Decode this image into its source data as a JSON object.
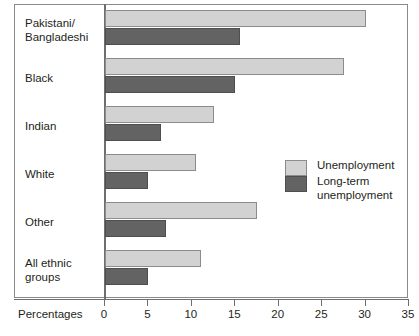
{
  "chart_data": {
    "type": "bar",
    "orientation": "horizontal",
    "title": "",
    "xlabel": "Percentages",
    "ylabel": "",
    "xlim": [
      0,
      35
    ],
    "xticks": [
      0,
      5,
      10,
      15,
      20,
      25,
      30,
      35
    ],
    "xtick_labels": [
      "0",
      "5",
      "10",
      "15",
      "20",
      "25",
      "30",
      "35"
    ],
    "grid": false,
    "legend_position": "center-right",
    "categories": [
      "Pakistani/\nBangladeshi",
      "Black",
      "Indian",
      "White",
      "Other",
      "All ethnic\ngroups"
    ],
    "series": [
      {
        "name": "Unemployment",
        "color": "#d2d2d2",
        "values": [
          30.0,
          27.5,
          12.5,
          10.5,
          17.5,
          11.0
        ]
      },
      {
        "name": "Long-term\nunemployment",
        "color": "#636363",
        "values": [
          15.5,
          15.0,
          6.5,
          5.0,
          7.0,
          5.0
        ]
      }
    ]
  },
  "axis": {
    "title": "Percentages"
  },
  "legend": {
    "items": [
      {
        "label": "Unemployment",
        "swatch": "light-grey-swatch"
      },
      {
        "label": "Long-term\nunemployment",
        "swatch": "dark-grey-swatch"
      }
    ]
  }
}
